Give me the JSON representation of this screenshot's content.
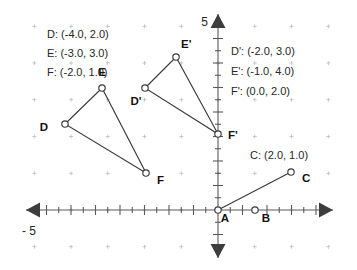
{
  "figure": {
    "title": "",
    "type": "coordinate-plane",
    "axis": {
      "x_label_left": "- 5",
      "y_label_top": "5",
      "x_range": [
        -5.6,
        5.6
      ],
      "y_range": [
        -1.6,
        5.6
      ],
      "unit_px": 24.5,
      "origin_px": [
        218,
        210
      ],
      "tick_step": 0.5,
      "major_tick_step": 1,
      "grid": "dots",
      "grid_step": 1.5,
      "arrows": [
        "left",
        "right",
        "up",
        "down"
      ]
    },
    "legends": {
      "left": {
        "lines": [
          "D: (-4.0, 2.0)",
          "E: (-3.0, 3.0)",
          "F: (-2.0, 1.0)"
        ]
      },
      "right": {
        "lines": [
          "D': (-2.0, 3.0)",
          "E': (-1.0, 4.0)",
          "F': (0.0, 2.0)"
        ]
      },
      "c_point": {
        "lines": [
          "C: (2.0, 1.0)"
        ]
      }
    },
    "points": [
      {
        "id": "D",
        "label": "D",
        "x": -4.0,
        "y": 2.0,
        "px": [
          65,
          124
        ],
        "label_px": [
          48,
          131
        ],
        "anchor": "end"
      },
      {
        "id": "E",
        "label": "E",
        "x": -3.0,
        "y": 3.0,
        "px": [
          102,
          88
        ],
        "label_px": [
          102,
          76
        ],
        "anchor": "middle"
      },
      {
        "id": "F",
        "label": "F",
        "x": -2.0,
        "y": 1.0,
        "px": [
          146,
          173
        ],
        "label_px": [
          157,
          184
        ],
        "anchor": "start"
      },
      {
        "id": "Dp",
        "label": "D'",
        "x": -2.0,
        "y": 3.0,
        "px": [
          145,
          88
        ],
        "label_px": [
          136,
          105
        ],
        "anchor": "middle"
      },
      {
        "id": "Ep",
        "label": "E'",
        "x": -1.0,
        "y": 4.0,
        "px": [
          176,
          57
        ],
        "label_px": [
          181,
          48
        ],
        "anchor": "start"
      },
      {
        "id": "Fp",
        "label": "F'",
        "x": 0.0,
        "y": 2.0,
        "px": [
          218,
          134
        ],
        "label_px": [
          228,
          139
        ],
        "anchor": "start"
      },
      {
        "id": "A",
        "label": "A",
        "x": 0.0,
        "y": 0.0,
        "px": [
          218,
          210
        ],
        "label_px": [
          225,
          222
        ],
        "anchor": "middle"
      },
      {
        "id": "B",
        "label": "B",
        "x": 1.0,
        "y": 0.0,
        "px": [
          255,
          210
        ],
        "label_px": [
          266,
          222
        ],
        "anchor": "middle"
      },
      {
        "id": "C",
        "label": "C",
        "x": 2.0,
        "y": 1.0,
        "px": [
          291,
          172
        ],
        "label_px": [
          302,
          182
        ],
        "anchor": "start"
      }
    ],
    "shapes": [
      {
        "name": "triangle-def",
        "vertices": [
          "D",
          "E",
          "F"
        ],
        "closed": true
      },
      {
        "name": "triangle-dpepfp",
        "vertices": [
          "Dp",
          "Ep",
          "Fp"
        ],
        "closed": true
      },
      {
        "name": "segment-ac",
        "vertices": [
          "A",
          "C"
        ],
        "closed": false
      }
    ],
    "colors": {
      "stroke": "#3a3a3a",
      "axis": "#5a5a5a",
      "marker_fill": "#ffffff",
      "grid_dot": "#b9b9b9",
      "text": "#262626",
      "background": "#ffffff"
    }
  },
  "chart_data": {
    "type": "scatter",
    "title": "",
    "xlabel": "",
    "ylabel": "",
    "xlim": [
      -5.6,
      5.6
    ],
    "ylim": [
      -1.6,
      5.6
    ],
    "grid": true,
    "legend_position": "inside",
    "tick_labels": {
      "x": [
        "- 5"
      ],
      "y": [
        "5"
      ]
    },
    "annotations": [
      "D: (-4.0, 2.0)",
      "E: (-3.0, 3.0)",
      "F: (-2.0, 1.0)",
      "D': (-2.0, 3.0)",
      "E': (-1.0, 4.0)",
      "F': (0.0, 2.0)",
      "C: (2.0, 1.0)"
    ],
    "series": [
      {
        "name": "Triangle DEF",
        "labels": [
          "D",
          "E",
          "F"
        ],
        "x": [
          -4.0,
          -3.0,
          -2.0
        ],
        "y": [
          2.0,
          3.0,
          1.0
        ],
        "closed": true
      },
      {
        "name": "Triangle D'E'F'",
        "labels": [
          "D'",
          "E'",
          "F'"
        ],
        "x": [
          -2.0,
          -1.0,
          0.0
        ],
        "y": [
          3.0,
          4.0,
          2.0
        ],
        "closed": true
      },
      {
        "name": "Segment AC",
        "labels": [
          "A",
          "B",
          "C"
        ],
        "x": [
          0.0,
          1.0,
          2.0
        ],
        "y": [
          0.0,
          0.0,
          1.0
        ],
        "closed": false
      }
    ]
  }
}
